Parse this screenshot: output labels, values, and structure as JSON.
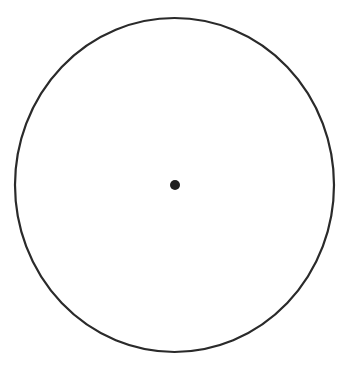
{
  "diagram": {
    "title": "",
    "shapes": [
      {
        "kind": "circle",
        "role": "outline",
        "stroke": "#2a2a2a",
        "fill": "none"
      },
      {
        "kind": "point",
        "role": "center",
        "fill": "#1e1e1e"
      }
    ]
  }
}
